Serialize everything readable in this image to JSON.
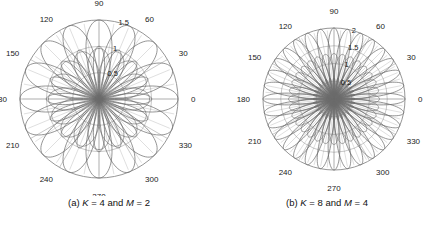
{
  "figure": {
    "background": "#ffffff",
    "line_color": "#6b6b6b",
    "grid_color": "#9a9a9a",
    "text_color": "#1a1a1a",
    "panels": [
      {
        "id": "a",
        "caption_prefix": "(a) ",
        "caption_k_symbol": "K",
        "caption_k_value": " = 4 and ",
        "caption_m_symbol": "M",
        "caption_m_value": " = 2",
        "caption_full": "(a) K = 4 and M = 2",
        "angular_labels": [
          "0",
          "30",
          "60",
          "90",
          "120",
          "150",
          "180",
          "210",
          "240",
          "270",
          "300",
          "330"
        ],
        "radial_labels": [
          "0.5",
          "1",
          "1.5"
        ],
        "center_x": 99,
        "center_y": 99,
        "outer_radius": 79
      },
      {
        "id": "b",
        "caption_prefix": "(b) ",
        "caption_k_symbol": "K",
        "caption_k_value": " = 8 and ",
        "caption_m_symbol": "M",
        "caption_m_value": " = 4",
        "caption_full": "(b) K = 8 and M = 4",
        "angular_labels": [
          "0",
          "30",
          "60",
          "90",
          "120",
          "150",
          "180",
          "210",
          "240",
          "270",
          "300",
          "330"
        ],
        "radial_labels": [
          "0.5",
          "1",
          "1.5",
          "2"
        ],
        "center_x": 116,
        "center_y": 99,
        "outer_radius": 71
      }
    ]
  },
  "chart_data": [
    {
      "type": "line",
      "subtype": "polar-rose",
      "panel": "a",
      "title": "(a) K = 4 and M = 2",
      "xlabel": "",
      "ylabel": "",
      "theta_unit": "degrees",
      "theta_ticks": [
        0,
        30,
        60,
        90,
        120,
        150,
        180,
        210,
        240,
        270,
        300,
        330
      ],
      "r_ticks": [
        0.5,
        1,
        1.5
      ],
      "rlim": [
        0,
        1.5
      ],
      "grid": true,
      "legend": "none",
      "parameters": {
        "K": 4,
        "M": 2
      },
      "series": [
        {
          "name": "rosette-lobes",
          "count": 16,
          "r_max": 1.5,
          "description": "16 closed petal loops radiating from origin, outer tips on r=1.5 circle"
        },
        {
          "name": "inner-loops",
          "count": 16,
          "r_max": 1.0,
          "description": "secondary loops reaching r=1.0"
        },
        {
          "name": "outer-boundary-circle",
          "r": 1.5
        }
      ]
    },
    {
      "type": "line",
      "subtype": "polar-rose",
      "panel": "b",
      "title": "(b) K = 8 and M = 4",
      "xlabel": "",
      "ylabel": "",
      "theta_unit": "degrees",
      "theta_ticks": [
        0,
        30,
        60,
        90,
        120,
        150,
        180,
        210,
        240,
        270,
        300,
        330
      ],
      "r_ticks": [
        0.5,
        1,
        1.5,
        2
      ],
      "rlim": [
        0,
        2
      ],
      "grid": true,
      "legend": "none",
      "parameters": {
        "K": 8,
        "M": 4
      },
      "series": [
        {
          "name": "rosette-lobes",
          "count": 32,
          "r_max": 2.0,
          "description": "32 closed petal loops radiating from origin, outer tips on r=2 circle"
        },
        {
          "name": "inner-loops",
          "count": 32,
          "r_max": 0.6,
          "description": "dense inner lobe cluster near origin"
        },
        {
          "name": "outer-boundary-circle",
          "r": 2.0
        }
      ]
    }
  ]
}
